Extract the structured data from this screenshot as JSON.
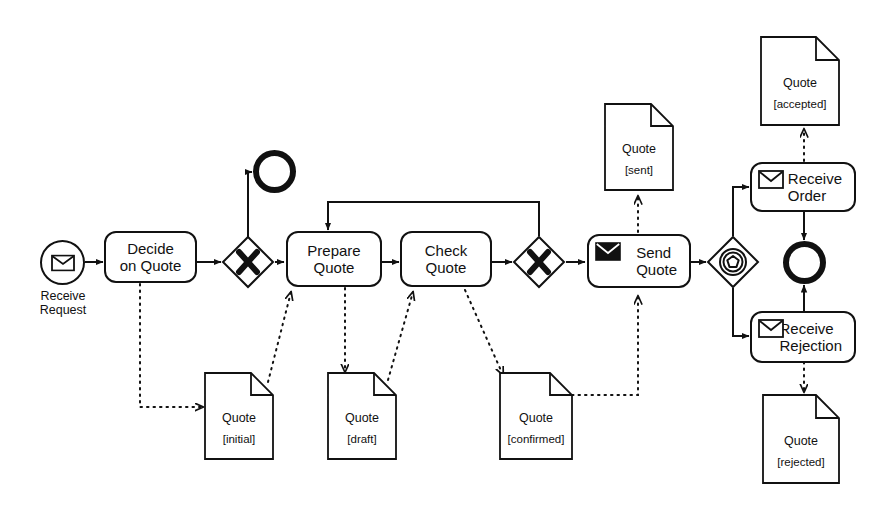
{
  "diagram": {
    "notation": "BPMN",
    "stroke_color": "#111111",
    "background_color": "#ffffff"
  },
  "events": [
    {
      "id": "start",
      "type": "message-start-event",
      "label": "Receive\nRequest",
      "icon": "envelope-outline-icon"
    },
    {
      "id": "end_cancel",
      "type": "end-event",
      "label": "",
      "icon": ""
    },
    {
      "id": "end_done",
      "type": "end-event",
      "label": "",
      "icon": ""
    }
  ],
  "tasks": [
    {
      "id": "decide",
      "label": "Decide\non Quote",
      "line1": "Decide",
      "line2": "on Quote",
      "icon": ""
    },
    {
      "id": "prepare",
      "label": "Prepare\nQuote",
      "line1": "Prepare",
      "line2": "Quote",
      "icon": ""
    },
    {
      "id": "check",
      "label": "Check\nQuote",
      "line1": "Check",
      "line2": "Quote",
      "icon": ""
    },
    {
      "id": "send",
      "label": "Send\nQuote",
      "line1": "Send",
      "line2": "Quote",
      "icon": "envelope-filled-icon"
    },
    {
      "id": "order",
      "label": "Receive\nOrder",
      "line1": "Receive",
      "line2": "Order",
      "icon": "envelope-outline-icon"
    },
    {
      "id": "reject",
      "label": "Receive\nRejection",
      "line1": "Receive",
      "line2": "Rejection",
      "icon": "envelope-outline-icon"
    }
  ],
  "gateways": [
    {
      "id": "gw1",
      "type": "exclusive-gateway",
      "symbol": "X",
      "label": ""
    },
    {
      "id": "gw2",
      "type": "exclusive-gateway",
      "symbol": "X",
      "label": ""
    },
    {
      "id": "gw3",
      "type": "event-based-gateway",
      "symbol": "pentagon",
      "label": ""
    }
  ],
  "data_objects": [
    {
      "id": "q_initial",
      "name": "Quote",
      "state": "[initial]"
    },
    {
      "id": "q_draft",
      "name": "Quote",
      "state": "[draft]"
    },
    {
      "id": "q_confirmed",
      "name": "Quote",
      "state": "[confirmed]"
    },
    {
      "id": "q_sent",
      "name": "Quote",
      "state": "[sent]"
    },
    {
      "id": "q_accepted",
      "name": "Quote",
      "state": "[accepted]"
    },
    {
      "id": "q_rejected",
      "name": "Quote",
      "state": "[rejected]"
    }
  ]
}
